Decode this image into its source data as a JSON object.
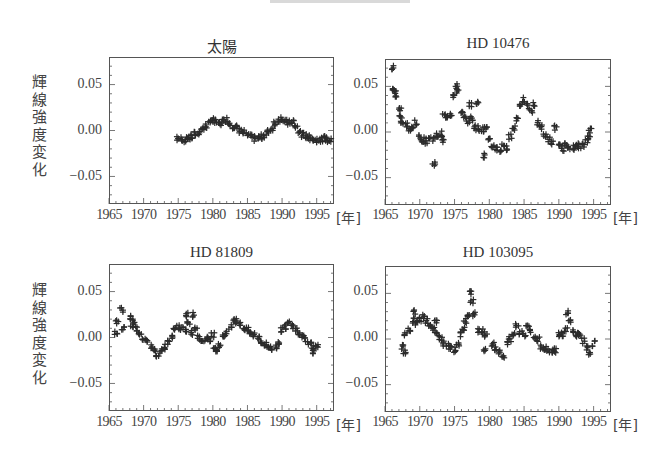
{
  "figure": {
    "ylabel": "輝線強度変化",
    "xunit": "[年]",
    "x_tick_labels": [
      "1965",
      "1970",
      "1975",
      "1980",
      "1985",
      "1990",
      "1995"
    ],
    "y_tick_labels": [
      "0.05",
      "0.00",
      "−0.05"
    ],
    "marker": "+",
    "marker_color": "#2b2b2b",
    "frame_color": "#555555"
  },
  "chart_data": [
    {
      "type": "scatter",
      "title": "太陽",
      "xlabel": "[年]",
      "ylabel": "輝線強度変化",
      "xlim": [
        1965,
        1997.5
      ],
      "ylim": [
        -0.08,
        0.08
      ],
      "x_ticks": [
        1965,
        1970,
        1975,
        1980,
        1985,
        1990,
        1995
      ],
      "y_ticks": [
        0.05,
        0.0,
        -0.05
      ],
      "grid": false,
      "series": [
        {
          "name": "太陽",
          "x": [
            1975.0,
            1975.5,
            1976.0,
            1976.5,
            1977.0,
            1977.5,
            1978.0,
            1978.5,
            1979.0,
            1979.5,
            1980.0,
            1980.5,
            1981.0,
            1981.5,
            1982.0,
            1982.5,
            1983.0,
            1983.5,
            1984.0,
            1984.5,
            1985.0,
            1985.5,
            1986.0,
            1986.5,
            1987.0,
            1987.5,
            1988.0,
            1988.5,
            1989.0,
            1989.5,
            1990.0,
            1990.5,
            1991.0,
            1991.5,
            1992.0,
            1992.5,
            1993.0,
            1993.5,
            1994.0,
            1994.5,
            1995.0,
            1995.5,
            1996.0,
            1996.5,
            1997.0
          ],
          "y": [
            -0.009,
            -0.009,
            -0.01,
            -0.008,
            -0.007,
            -0.004,
            -0.002,
            0.002,
            0.005,
            0.008,
            0.012,
            0.009,
            0.007,
            0.01,
            0.012,
            0.008,
            0.005,
            0.003,
            0.0,
            -0.002,
            -0.005,
            -0.007,
            -0.009,
            -0.008,
            -0.007,
            -0.005,
            -0.002,
            0.002,
            0.008,
            0.012,
            0.013,
            0.009,
            0.008,
            0.01,
            0.004,
            -0.002,
            -0.005,
            -0.006,
            -0.008,
            -0.009,
            -0.01,
            -0.01,
            -0.009,
            -0.01,
            -0.01
          ]
        }
      ]
    },
    {
      "type": "scatter",
      "title": "HD 10476",
      "xlabel": "[年]",
      "ylabel": "",
      "xlim": [
        1965,
        1997.5
      ],
      "ylim": [
        -0.08,
        0.08
      ],
      "x_ticks": [
        1965,
        1970,
        1975,
        1980,
        1985,
        1990,
        1995
      ],
      "y_ticks": [
        0.05,
        0.0,
        -0.05
      ],
      "grid": false,
      "series": [
        {
          "name": "HD 10476",
          "x": [
            1966.2,
            1966.3,
            1966.4,
            1966.5,
            1967.2,
            1967.3,
            1967.5,
            1968.0,
            1968.5,
            1969.0,
            1969.5,
            1970.0,
            1970.5,
            1971.0,
            1971.5,
            1972.0,
            1972.0,
            1972.5,
            1973.0,
            1973.3,
            1973.5,
            1974.0,
            1974.5,
            1975.0,
            1975.2,
            1975.5,
            1976.0,
            1976.5,
            1977.0,
            1977.3,
            1977.5,
            1978.0,
            1978.3,
            1978.5,
            1979.0,
            1979.3,
            1979.5,
            1980.0,
            1980.5,
            1981.0,
            1981.5,
            1982.0,
            1982.5,
            1983.0,
            1983.5,
            1984.0,
            1984.5,
            1985.0,
            1985.5,
            1986.0,
            1986.5,
            1987.0,
            1987.5,
            1988.0,
            1988.5,
            1989.0,
            1989.5,
            1990.0,
            1990.5,
            1991.0,
            1991.5,
            1992.0,
            1992.5,
            1993.0,
            1993.5,
            1994.0,
            1994.3,
            1994.5
          ],
          "y": [
            0.07,
            0.048,
            0.044,
            0.04,
            0.025,
            0.018,
            0.01,
            0.008,
            0.002,
            0.004,
            0.01,
            -0.006,
            -0.008,
            -0.01,
            -0.007,
            -0.034,
            -0.008,
            -0.004,
            -0.002,
            -0.01,
            0.018,
            0.018,
            0.02,
            0.04,
            0.05,
            0.045,
            0.02,
            0.015,
            0.012,
            0.03,
            0.015,
            0.005,
            0.033,
            0.004,
            0.003,
            -0.026,
            0.004,
            -0.01,
            -0.015,
            -0.018,
            -0.02,
            -0.015,
            -0.018,
            -0.005,
            0.005,
            0.015,
            0.03,
            0.035,
            0.028,
            0.022,
            0.03,
            0.01,
            0.005,
            -0.003,
            -0.008,
            -0.012,
            0.005,
            -0.016,
            -0.018,
            -0.015,
            -0.016,
            -0.017,
            -0.016,
            -0.015,
            -0.015,
            -0.01,
            -0.005,
            0.002
          ]
        }
      ]
    },
    {
      "type": "scatter",
      "title": "HD 81809",
      "xlabel": "[年]",
      "ylabel": "輝線強度変化",
      "xlim": [
        1965,
        1997.5
      ],
      "ylim": [
        -0.08,
        0.08
      ],
      "x_ticks": [
        1965,
        1970,
        1975,
        1980,
        1985,
        1990,
        1995
      ],
      "y_ticks": [
        0.05,
        0.0,
        -0.05
      ],
      "grid": false,
      "series": [
        {
          "name": "HD 81809",
          "x": [
            1966.0,
            1966.2,
            1966.8,
            1967.0,
            1968.0,
            1968.3,
            1968.5,
            1969.0,
            1969.5,
            1970.0,
            1970.5,
            1971.0,
            1971.5,
            1972.0,
            1972.5,
            1973.0,
            1973.5,
            1974.0,
            1974.5,
            1975.0,
            1975.5,
            1976.0,
            1976.3,
            1976.5,
            1977.0,
            1977.3,
            1977.5,
            1978.0,
            1978.5,
            1979.0,
            1979.5,
            1980.0,
            1980.3,
            1980.5,
            1981.0,
            1981.5,
            1982.0,
            1982.5,
            1983.0,
            1983.5,
            1984.0,
            1984.5,
            1985.0,
            1985.5,
            1986.0,
            1986.5,
            1987.0,
            1987.5,
            1988.0,
            1988.5,
            1989.0,
            1989.5,
            1990.0,
            1990.5,
            1991.0,
            1991.5,
            1992.0,
            1992.5,
            1993.0,
            1993.5,
            1994.0,
            1994.3,
            1994.5,
            1995.0
          ],
          "y": [
            0.006,
            0.017,
            0.03,
            0.01,
            0.022,
            0.013,
            0.018,
            0.01,
            0.005,
            0.0,
            -0.005,
            -0.01,
            -0.014,
            -0.018,
            -0.015,
            -0.01,
            -0.005,
            0.002,
            0.008,
            0.012,
            0.01,
            0.006,
            0.025,
            0.015,
            0.005,
            0.025,
            0.01,
            0.0,
            -0.002,
            -0.002,
            -0.002,
            0.003,
            -0.01,
            -0.014,
            -0.008,
            0.0,
            0.005,
            0.012,
            0.02,
            0.018,
            0.015,
            0.01,
            0.008,
            0.005,
            0.003,
            0.0,
            -0.004,
            -0.008,
            -0.01,
            -0.012,
            -0.01,
            -0.005,
            0.008,
            0.012,
            0.015,
            0.012,
            0.01,
            0.005,
            0.003,
            -0.002,
            -0.005,
            -0.012,
            -0.015,
            -0.01
          ]
        }
      ]
    },
    {
      "type": "scatter",
      "title": "HD 103095",
      "xlabel": "[年]",
      "ylabel": "",
      "xlim": [
        1965,
        1997.5
      ],
      "ylim": [
        -0.08,
        0.08
      ],
      "x_ticks": [
        1965,
        1970,
        1975,
        1980,
        1985,
        1990,
        1995
      ],
      "y_ticks": [
        0.05,
        0.0,
        -0.05
      ],
      "grid": false,
      "series": [
        {
          "name": "HD 103095",
          "x": [
            1967.5,
            1967.8,
            1968.0,
            1968.5,
            1969.0,
            1969.3,
            1969.5,
            1970.0,
            1970.5,
            1971.0,
            1971.5,
            1972.0,
            1972.3,
            1972.5,
            1973.0,
            1973.5,
            1974.0,
            1974.5,
            1975.0,
            1975.5,
            1976.0,
            1976.3,
            1976.5,
            1977.0,
            1977.2,
            1977.5,
            1977.8,
            1978.5,
            1979.0,
            1979.3,
            1979.5,
            1980.5,
            1981.0,
            1981.5,
            1982.0,
            1982.5,
            1983.0,
            1983.5,
            1984.0,
            1984.5,
            1985.0,
            1985.5,
            1986.0,
            1986.5,
            1987.0,
            1987.5,
            1988.0,
            1988.5,
            1989.0,
            1989.5,
            1990.0,
            1990.5,
            1991.0,
            1991.2,
            1991.5,
            1992.0,
            1992.5,
            1993.0,
            1993.5,
            1994.0,
            1994.5,
            1995.0
          ],
          "y": [
            -0.008,
            -0.014,
            0.005,
            0.01,
            0.02,
            0.03,
            0.018,
            0.022,
            0.025,
            0.02,
            0.015,
            0.01,
            0.018,
            0.005,
            0.0,
            -0.005,
            -0.008,
            -0.01,
            -0.012,
            -0.005,
            0.005,
            0.012,
            0.02,
            0.025,
            0.05,
            0.042,
            0.028,
            0.01,
            0.008,
            -0.012,
            0.005,
            -0.005,
            -0.01,
            -0.015,
            -0.02,
            -0.005,
            0.0,
            0.005,
            0.015,
            0.008,
            0.005,
            0.015,
            0.008,
            0.003,
            0.0,
            -0.008,
            -0.01,
            -0.012,
            -0.014,
            -0.012,
            0.005,
            0.005,
            0.01,
            0.028,
            0.02,
            0.008,
            0.005,
            0.005,
            -0.002,
            -0.01,
            -0.015,
            -0.005
          ]
        }
      ]
    }
  ]
}
